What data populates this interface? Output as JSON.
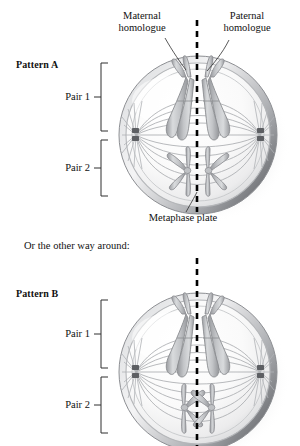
{
  "figure": {
    "type": "biology-diagram",
    "background_color": "#ffffff"
  },
  "annotations": {
    "maternal_homologue": "Maternal\nhomologue",
    "paternal_homologue": "Paternal\nhomologue",
    "metaphase_plate": "Metaphase plate",
    "transition_text": "Or the other way around:"
  },
  "panels": [
    {
      "id": "pattern-a",
      "title": "Pattern A",
      "brackets": [
        {
          "label": "Pair 1"
        },
        {
          "label": "Pair 2"
        }
      ],
      "cell": {
        "pair1": {
          "left_chromosome_shade": "light",
          "right_chromosome_shade": "light",
          "description": "long metacentric chromosomes, arms sweeping downward"
        },
        "pair2": {
          "left_chromosome_shade": "light",
          "right_chromosome_shade": "light",
          "description": "short X-shaped chromosomes below pair 1"
        },
        "centrosomes": 2,
        "spindle": "bipolar"
      }
    },
    {
      "id": "pattern-b",
      "title": "Pattern B",
      "brackets": [
        {
          "label": "Pair 1"
        },
        {
          "label": "Pair 2"
        }
      ],
      "cell": {
        "pair1": {
          "left_chromosome_shade": "light",
          "right_chromosome_shade": "light",
          "description": "long metacentric chromosomes, arms sweeping downward"
        },
        "pair2": {
          "left_chromosome_shade": "light",
          "right_chromosome_shade": "light",
          "description": "short X-shaped chromosomes, orientation reversed versus pattern A"
        },
        "centrosomes": 2,
        "spindle": "bipolar"
      }
    }
  ],
  "colors": {
    "outline": "#8e9094",
    "chromosome_fill": "#c9cbcd",
    "chromosome_edge": "#8b8d91",
    "cell_rim": "#b9bbbe",
    "cell_shadow": "#6f7175",
    "dashed_line": "#000000",
    "leader_line": "#3a3a3a",
    "bracket": "#3a3a3a"
  }
}
